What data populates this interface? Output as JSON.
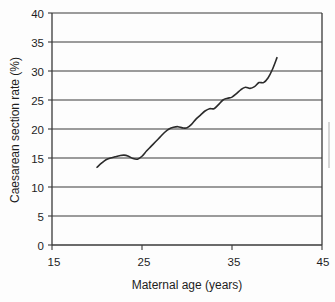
{
  "chart_data": {
    "type": "line",
    "title": "",
    "subtitle": "",
    "xlabel": "Maternal age (years)",
    "ylabel": "Caesarean section rate (%)",
    "xlim": [
      15,
      45
    ],
    "ylim": [
      0,
      40
    ],
    "xticks": [
      15,
      25,
      35,
      45
    ],
    "yticks": [
      0,
      5,
      10,
      15,
      20,
      25,
      30,
      35,
      40
    ],
    "xtick_labels": [
      "15",
      "25",
      "35",
      "45"
    ],
    "ytick_labels": [
      "0",
      "5",
      "10",
      "15",
      "20",
      "25",
      "30",
      "35",
      "40"
    ],
    "grid": "horizontal",
    "legend": "none",
    "line_color": "#2b2b2b",
    "axis_color": "#3a3a3a",
    "background_color": "#fdfdfd",
    "series": [
      {
        "name": "Caesarean section rate",
        "x": [
          20.0,
          20.5,
          21.0,
          21.5,
          22.0,
          22.5,
          23.0,
          23.5,
          24.0,
          24.5,
          25.0,
          25.5,
          26.0,
          26.5,
          27.0,
          27.5,
          28.0,
          28.5,
          29.0,
          29.5,
          30.0,
          30.5,
          31.0,
          31.5,
          32.0,
          32.5,
          33.0,
          33.5,
          34.0,
          34.5,
          35.0,
          35.5,
          36.0,
          36.5,
          37.0,
          37.5,
          38.0,
          38.5,
          39.0,
          39.5,
          40.0
        ],
        "values": [
          13.4,
          14.1,
          14.7,
          15.0,
          15.2,
          15.4,
          15.5,
          15.3,
          14.9,
          14.8,
          15.3,
          16.2,
          17.0,
          17.8,
          18.6,
          19.4,
          20.0,
          20.3,
          20.4,
          20.2,
          20.2,
          20.8,
          21.7,
          22.4,
          23.1,
          23.5,
          23.5,
          24.2,
          25.0,
          25.3,
          25.5,
          26.1,
          26.8,
          27.2,
          27.0,
          27.3,
          28.0,
          28.0,
          28.8,
          30.3,
          32.3
        ]
      }
    ]
  },
  "axes": {
    "y_title": "Caesarean section rate (%)",
    "x_title": "Maternal age (years)"
  }
}
